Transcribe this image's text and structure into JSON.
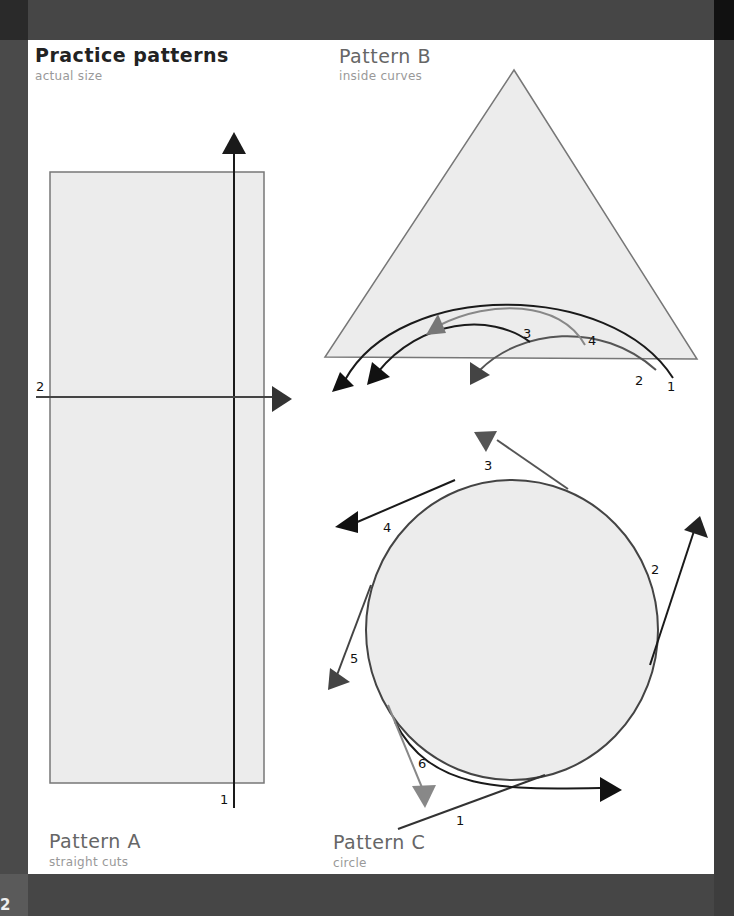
{
  "page": {
    "number": "2",
    "heading": {
      "title": "Practice patterns",
      "subtitle": "actual size"
    }
  },
  "patterns": [
    {
      "id": "A",
      "title": "Pattern A",
      "subtitle": "straight cuts",
      "shape": "rectangle",
      "cuts": [
        {
          "label": "1",
          "direction": "up"
        },
        {
          "label": "2",
          "direction": "right"
        }
      ]
    },
    {
      "id": "B",
      "title": "Pattern B",
      "subtitle": "inside curves",
      "shape": "triangle",
      "cuts": [
        {
          "label": "1"
        },
        {
          "label": "2"
        },
        {
          "label": "3"
        },
        {
          "label": "4"
        }
      ]
    },
    {
      "id": "C",
      "title": "Pattern C",
      "subtitle": "circle",
      "shape": "circle",
      "cuts": [
        {
          "label": "1"
        },
        {
          "label": "2"
        },
        {
          "label": "3"
        },
        {
          "label": "4"
        },
        {
          "label": "5"
        },
        {
          "label": "6"
        }
      ]
    }
  ],
  "colors": {
    "shape_fill": "#ececec",
    "shape_stroke": "#777777",
    "cut_dark": "#1a1a1a",
    "cut_medium": "#555555",
    "cut_light": "#888888"
  }
}
